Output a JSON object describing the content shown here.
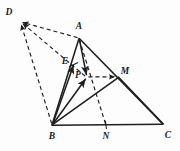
{
  "figure": {
    "background_color": "#fdfdfd",
    "stroke_color": "#1f1f1f",
    "solid_stroke_width": 1.5,
    "dashed_stroke_width": 1.2,
    "dash_pattern": "4 3"
  },
  "points": [
    {
      "id": "D",
      "label": "D",
      "x": 20,
      "y": 21,
      "label_x": 9,
      "label_y": 13,
      "kind": "external-arrow-tip"
    },
    {
      "id": "A",
      "label": "A",
      "x": 79,
      "y": 38,
      "label_x": 79,
      "label_y": 27,
      "kind": "triangle-vertex"
    },
    {
      "id": "E",
      "label": "E",
      "x": 73,
      "y": 64,
      "label_x": 65,
      "label_y": 62,
      "kind": "segment-point"
    },
    {
      "id": "P",
      "label": "P",
      "x": 86,
      "y": 77,
      "label_x": 78,
      "label_y": 76,
      "kind": "interior-point"
    },
    {
      "id": "M",
      "label": "M",
      "x": 118,
      "y": 77,
      "label_x": 125,
      "label_y": 72,
      "kind": "segment-point"
    },
    {
      "id": "B",
      "label": "B",
      "x": 52,
      "y": 125,
      "label_x": 52,
      "label_y": 137,
      "kind": "triangle-vertex"
    },
    {
      "id": "N",
      "label": "N",
      "x": 106,
      "y": 125,
      "label_x": 106,
      "label_y": 137,
      "kind": "segment-point"
    },
    {
      "id": "C",
      "label": "C",
      "x": 163,
      "y": 124,
      "label_x": 168,
      "label_y": 136,
      "kind": "triangle-vertex"
    }
  ],
  "solid_segments": [
    {
      "id": "AB",
      "name": "segment-a-b",
      "from": "A",
      "to": "B",
      "arrow": "none"
    },
    {
      "id": "AC",
      "name": "segment-a-c",
      "from": "A",
      "to": "C",
      "arrow": "none"
    },
    {
      "id": "BC",
      "name": "segment-b-c",
      "from": "B",
      "to": "C",
      "arrow": "none"
    },
    {
      "id": "AP",
      "name": "segment-a-p",
      "from": "A",
      "to": "P",
      "arrow": "end"
    },
    {
      "id": "BM",
      "name": "segment-b-m-c",
      "from": "B",
      "to": "C",
      "via": "M",
      "arrow": "none"
    },
    {
      "id": "BE",
      "name": "segment-b-e",
      "from": "B",
      "to": "E",
      "arrow": "end"
    }
  ],
  "dashed_segments": [
    {
      "id": "DA",
      "name": "dashed-d-a",
      "from": "A",
      "to": "D",
      "arrow": "end"
    },
    {
      "id": "DP",
      "name": "dashed-d-p-m",
      "from": "M",
      "to": "D",
      "arrow": "both"
    },
    {
      "id": "DB",
      "name": "dashed-d-b",
      "from": "B",
      "to": "D",
      "arrow": "end"
    },
    {
      "id": "AN",
      "name": "dashed-a-p-n",
      "from": "A",
      "to": "N",
      "arrow": "none"
    },
    {
      "id": "PM",
      "name": "dashed-p-m",
      "from": "P",
      "to": "M",
      "arrow": "end"
    }
  ],
  "labels": {
    "D": "D",
    "A": "A",
    "E": "E",
    "P": "P",
    "M": "M",
    "B": "B",
    "N": "N",
    "C": "C"
  }
}
